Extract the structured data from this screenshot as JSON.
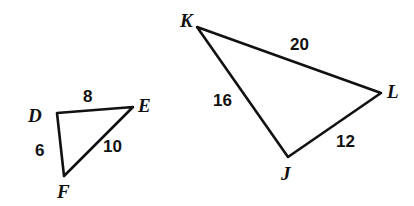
{
  "figure": {
    "background_color": "#ffffff",
    "stroke_color": "#111111",
    "text_color": "#111111",
    "stroke_width": 2.6,
    "width": 414,
    "height": 206
  },
  "triangles": [
    {
      "name": "triangle-def",
      "vertices": [
        {
          "id": "D",
          "label": "D",
          "x": 57,
          "y": 113,
          "label_x": 28,
          "label_y": 106
        },
        {
          "id": "E",
          "label": "E",
          "x": 133,
          "y": 107,
          "label_x": 138,
          "label_y": 96
        },
        {
          "id": "F",
          "label": "F",
          "x": 64,
          "y": 176,
          "label_x": 57,
          "label_y": 182
        }
      ],
      "sides": [
        {
          "id": "DE",
          "label": "8",
          "from": "D",
          "to": "E",
          "label_x": 83,
          "label_y": 88
        },
        {
          "id": "DF",
          "label": "6",
          "from": "D",
          "to": "F",
          "label_x": 35,
          "label_y": 142
        },
        {
          "id": "FE",
          "label": "10",
          "from": "F",
          "to": "E",
          "label_x": 103,
          "label_y": 138
        }
      ]
    },
    {
      "name": "triangle-jkl",
      "vertices": [
        {
          "id": "K",
          "label": "K",
          "x": 197,
          "y": 27,
          "label_x": 180,
          "label_y": 11
        },
        {
          "id": "L",
          "label": "L",
          "x": 381,
          "y": 93,
          "label_x": 387,
          "label_y": 82
        },
        {
          "id": "J",
          "label": "J",
          "x": 288,
          "y": 157,
          "label_x": 281,
          "label_y": 164
        }
      ],
      "sides": [
        {
          "id": "KL",
          "label": "20",
          "from": "K",
          "to": "L",
          "label_x": 290,
          "label_y": 36
        },
        {
          "id": "KJ",
          "label": "16",
          "from": "K",
          "to": "J",
          "label_x": 213,
          "label_y": 92
        },
        {
          "id": "JL",
          "label": "12",
          "from": "J",
          "to": "L",
          "label_x": 336,
          "label_y": 133
        }
      ]
    }
  ]
}
